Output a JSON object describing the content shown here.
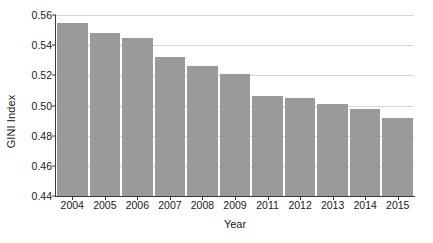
{
  "chart_data": {
    "type": "bar",
    "title": "",
    "xlabel": "Year",
    "ylabel": "GINI Index",
    "categories": [
      "2004",
      "2005",
      "2006",
      "2007",
      "2008",
      "2009",
      "2011",
      "2012",
      "2013",
      "2014",
      "2015"
    ],
    "values": [
      0.555,
      0.548,
      0.545,
      0.532,
      0.526,
      0.521,
      0.506,
      0.505,
      0.501,
      0.498,
      0.492
    ],
    "ylim": [
      0.44,
      0.56
    ],
    "yticks": [
      0.44,
      0.46,
      0.48,
      0.5,
      0.52,
      0.54,
      0.56
    ],
    "ytick_labels": [
      "0.44",
      "0.46",
      "0.48",
      "0.50",
      "0.52",
      "0.54",
      "0.56"
    ],
    "grid": "horizontal",
    "legend": "none",
    "bar_color": "#9a9a9a",
    "grid_color": "#d6d6d6",
    "axis_color": "#3a3a3a",
    "background_color": "#ffffff"
  }
}
